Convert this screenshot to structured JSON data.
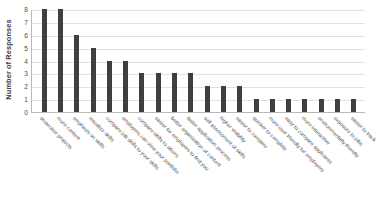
{
  "chart_data": {
    "type": "bar",
    "title": "",
    "xlabel": "",
    "ylabel": "Number of Responses",
    "ylim": [
      0,
      8
    ],
    "yticks": [
      0,
      1,
      2,
      3,
      4,
      5,
      6,
      7,
      8
    ],
    "grid": true,
    "legend": null,
    "bar_color": "#3f3f3f",
    "categories": [
      "showcase projects",
      "more content",
      "emphasis on skills",
      "visualize skills",
      "compare job skills to your skills",
      "employers can view your portfolio",
      "compare skills to others",
      "easier for employers to find you",
      "better organization of content",
      "faster application process",
      "self assessment of skills",
      "higher visibility",
      "easier to compare",
      "quicker to complete",
      "more user friendly for employers",
      "easy to compare applicants",
      "more interactive",
      "environmentally friendly",
      "exposure to jobs",
      "easier to track"
    ],
    "values": [
      8,
      8,
      6,
      5,
      4,
      4,
      3,
      3,
      3,
      3,
      2,
      2,
      2,
      1,
      1,
      1,
      1,
      1,
      1,
      1
    ]
  }
}
